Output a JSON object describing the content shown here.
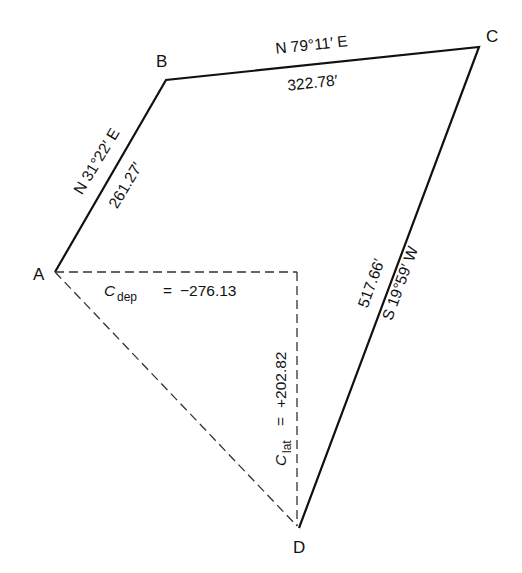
{
  "diagram": {
    "type": "traverse-closure",
    "vertices": [
      {
        "id": "A",
        "label": "A"
      },
      {
        "id": "B",
        "label": "B"
      },
      {
        "id": "C",
        "label": "C"
      },
      {
        "id": "D",
        "label": "D"
      }
    ],
    "edges": [
      {
        "from": "A",
        "to": "B",
        "bearing": "N 31°22′ E",
        "length": "261.27′",
        "style": "solid"
      },
      {
        "from": "B",
        "to": "C",
        "bearing": "N 79°11′ E",
        "length": "322.78′",
        "style": "solid"
      },
      {
        "from": "C",
        "to": "D",
        "bearing": "S 19°59′ W",
        "length": "517.66′",
        "style": "solid"
      },
      {
        "from": "D",
        "to": "A",
        "style": "dashed",
        "label": "closing line"
      }
    ],
    "closure": {
      "departure": {
        "symbol": "C",
        "subscript": "dep",
        "equals": "=",
        "value": "−276.13"
      },
      "latitude": {
        "symbol": "C",
        "subscript": "lat",
        "equals": "=",
        "value": "+202.82"
      }
    },
    "colors": {
      "line": "#111111",
      "background": "#ffffff"
    }
  }
}
